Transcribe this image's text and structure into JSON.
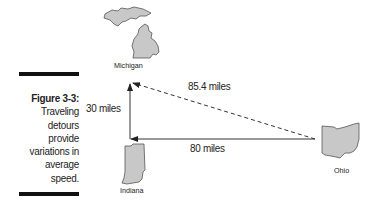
{
  "caption": {
    "figure_label": "Figure 3-3:",
    "text_lines": [
      "Traveling",
      "detours",
      "provide",
      "variations in",
      "average",
      "speed."
    ]
  },
  "states": {
    "michigan": "Michigan",
    "indiana": "Indiana",
    "ohio": "Ohio"
  },
  "distances": {
    "vertical": "30 miles",
    "horizontal": "80 miles",
    "diagonal": "85.4 miles"
  },
  "colors": {
    "state_fill": "#c8c8c8",
    "state_stroke": "#555555",
    "line": "#333333",
    "bar": "#111111"
  }
}
